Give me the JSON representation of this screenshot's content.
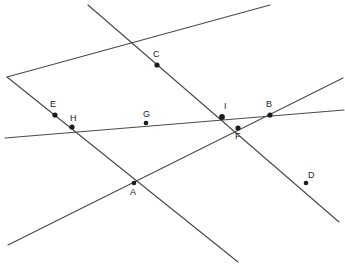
{
  "figure": {
    "background_color": "#ffffff",
    "line_color": "#4a4a4a",
    "point_color": "#1c1c1c",
    "width": 345,
    "height": 273
  },
  "chart_data": {
    "type": "scatter",
    "xlabel": "",
    "ylabel": "",
    "xlim": [
      0,
      345
    ],
    "ylim": [
      0,
      273
    ],
    "grid": false,
    "legend": "none",
    "lines": [
      {
        "name": "line-1",
        "description": "Line through E, C, I, F and continuing to lower right through D",
        "x1": 88,
        "y1": 5,
        "x2": 339,
        "y2": 222,
        "passes_through": [
          "C",
          "I",
          "F",
          "D"
        ]
      },
      {
        "name": "line-2",
        "description": "Line rising from lower left through E, C region to upper right",
        "x1": 7,
        "y1": 77,
        "x2": 270,
        "y2": 5,
        "passes_through": [
          "E",
          "C"
        ]
      },
      {
        "name": "line-3",
        "description": "Near-horizontal line through H, G, I, B",
        "x1": 5,
        "y1": 138,
        "x2": 344,
        "y2": 110,
        "passes_through": [
          "H",
          "G",
          "I",
          "B"
        ]
      },
      {
        "name": "line-4",
        "description": "Line from lower left rising through A, F, B to the upper right edge",
        "x1": 8,
        "y1": 245,
        "x2": 343,
        "y2": 78,
        "passes_through": [
          "A",
          "F",
          "B"
        ]
      },
      {
        "name": "line-5",
        "description": "Line descending from upper left through E, H, A to lower right",
        "x1": 7,
        "y1": 77,
        "x2": 238,
        "y2": 262,
        "passes_through": [
          "E",
          "H",
          "A"
        ]
      }
    ],
    "points": [
      {
        "label": "A",
        "x": 134,
        "y": 183,
        "label_x": 130,
        "label_y": 188,
        "dot_r": 2.3
      },
      {
        "label": "B",
        "x": 270,
        "y": 115,
        "label_x": 266,
        "label_y": 100,
        "dot_r": 2.6
      },
      {
        "label": "C",
        "x": 157,
        "y": 65,
        "label_x": 153,
        "label_y": 50,
        "dot_r": 2.6
      },
      {
        "label": "D",
        "x": 306,
        "y": 183,
        "label_x": 308,
        "label_y": 171,
        "dot_r": 2.3
      },
      {
        "label": "E",
        "x": 55,
        "y": 115,
        "label_x": 50,
        "label_y": 100,
        "dot_r": 2.6
      },
      {
        "label": "F",
        "x": 238,
        "y": 128,
        "label_x": 235,
        "label_y": 132,
        "dot_r": 2.6
      },
      {
        "label": "G",
        "x": 146,
        "y": 123,
        "label_x": 143,
        "label_y": 110,
        "dot_r": 2.3
      },
      {
        "label": "H",
        "x": 72,
        "y": 127,
        "label_x": 70,
        "label_y": 114,
        "dot_r": 2.6
      },
      {
        "label": "I",
        "x": 222,
        "y": 117,
        "label_x": 224,
        "label_y": 102,
        "dot_r": 2.9
      }
    ]
  }
}
